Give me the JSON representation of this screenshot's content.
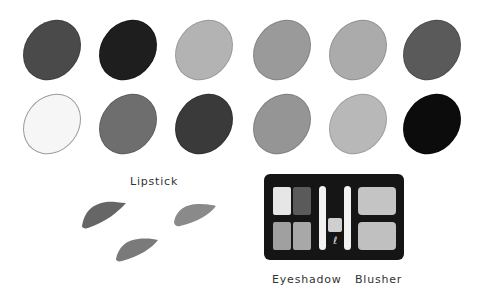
{
  "swatches": {
    "row1": [
      {
        "name": "swatch-1",
        "color": "#4a4a4a"
      },
      {
        "name": "swatch-2",
        "color": "#1e1e1e"
      },
      {
        "name": "swatch-3",
        "color": "#b3b3b3"
      },
      {
        "name": "swatch-4",
        "color": "#9a9a9a"
      },
      {
        "name": "swatch-5",
        "color": "#ababab"
      },
      {
        "name": "swatch-6",
        "color": "#5a5a5a"
      }
    ],
    "row2": [
      {
        "name": "swatch-7",
        "color": "#f6f6f6"
      },
      {
        "name": "swatch-8",
        "color": "#6e6e6e"
      },
      {
        "name": "swatch-9",
        "color": "#3a3a3a"
      },
      {
        "name": "swatch-10",
        "color": "#959595"
      },
      {
        "name": "swatch-11",
        "color": "#b8b8b8"
      },
      {
        "name": "swatch-12",
        "color": "#0c0c0c"
      }
    ]
  },
  "labels": {
    "lipstick": "Lipstick",
    "eyeshadow": "Eyeshadow",
    "blusher": "Blusher"
  },
  "lipstick_colors": [
    "#666666",
    "#8a8a8a",
    "#7a7a7a"
  ],
  "palette": {
    "case_color": "#151515",
    "eyeshadow_pans": [
      "#e6e6e6",
      "#5a5a5a",
      "#a0a0a0",
      "#a8a8a8"
    ],
    "center_pan": "#cfcfcf",
    "blusher_pans": [
      "#c4c4c4",
      "#c0c0c0"
    ]
  }
}
